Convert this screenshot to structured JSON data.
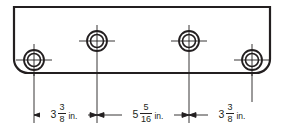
{
  "drawing": {
    "title": "Mounting plate hole layout",
    "line_color": "#231f20",
    "background_color": "#ffffff",
    "plate": {
      "name": "rectangular plate outline",
      "left": 14,
      "top": 7,
      "right": 270,
      "bottom": 73,
      "corner_radius_bottom": 14
    },
    "holes": [
      {
        "id": "hole-bottom-left",
        "cx": 34,
        "cy": 60,
        "r_outer": 10,
        "r_inner": 6.5
      },
      {
        "id": "hole-top-left",
        "cx": 97,
        "cy": 41,
        "r_outer": 10,
        "r_inner": 6.5
      },
      {
        "id": "hole-top-right",
        "cx": 189,
        "cy": 41,
        "r_outer": 10,
        "r_inner": 6.5
      },
      {
        "id": "hole-bottom-right",
        "cx": 252,
        "cy": 60,
        "r_outer": 10,
        "r_inner": 6.5
      }
    ],
    "dimension_line_y": 115,
    "dimensions": [
      {
        "id": "dim-left",
        "from_x": 34,
        "to_x": 97,
        "whole": "3",
        "numerator": "3",
        "denominator": "8",
        "unit": "in.",
        "text": "3 3/8 in."
      },
      {
        "id": "dim-middle",
        "from_x": 97,
        "to_x": 189,
        "whole": "5",
        "numerator": "5",
        "denominator": "16",
        "unit": "in.",
        "text": "5 5/16 in."
      },
      {
        "id": "dim-right",
        "from_x": 189,
        "to_x": 252,
        "whole": "3",
        "numerator": "3",
        "denominator": "8",
        "unit": "in.",
        "text": "3 3/8 in."
      }
    ]
  }
}
